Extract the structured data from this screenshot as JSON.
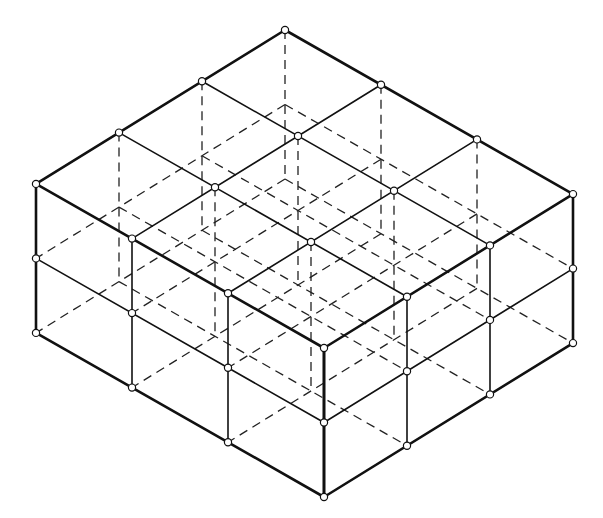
{
  "diagram": {
    "title": "",
    "grid": {
      "cells_left": 3,
      "cells_right": 3,
      "levels": 2
    },
    "projection": {
      "origin": [
        285,
        30
      ],
      "axis_left": [
        -83,
        51.3
      ],
      "axis_right": [
        96,
        54.7
      ],
      "level_height": 74.5
    },
    "style": {
      "line_color": "#111111",
      "outer_edge_width": 2.6,
      "inner_edge_width": 1.6,
      "node_radius": 3.6,
      "background": "#ffffff"
    },
    "labels": []
  }
}
